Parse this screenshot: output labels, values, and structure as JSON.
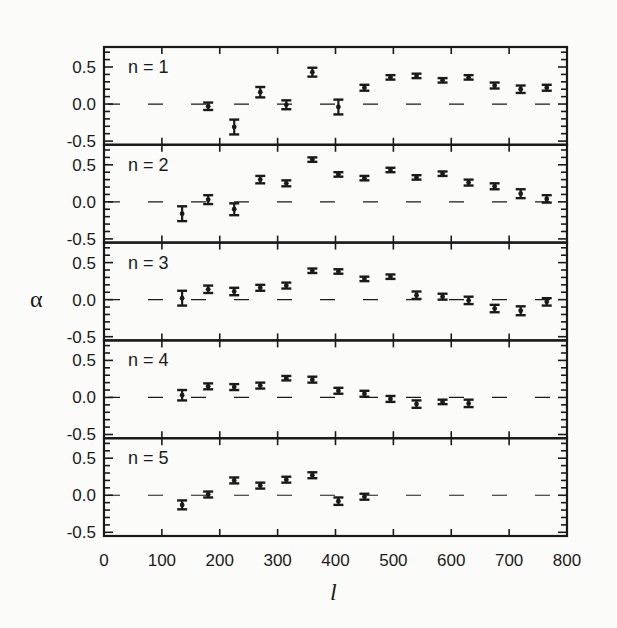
{
  "chart_data": {
    "type": "scatter",
    "title": "",
    "xlabel": "l",
    "ylabel": "α",
    "xlim": [
      0,
      800
    ],
    "ylim_per_panel": [
      -0.55,
      0.77
    ],
    "x_ticks": [
      0,
      100,
      200,
      300,
      400,
      500,
      600,
      700,
      800
    ],
    "y_ticks": [
      "0.5",
      "0.0",
      "-0.5"
    ],
    "grid": false,
    "legend": null,
    "reference_line": {
      "y": 0,
      "style": "dashed"
    },
    "error_bars": true,
    "panels": [
      {
        "label": "n = 1",
        "x": [
          180,
          225,
          270,
          315,
          360,
          405,
          450,
          495,
          540,
          585,
          630,
          675,
          720,
          765
        ],
        "y": [
          -0.03,
          -0.31,
          0.16,
          -0.01,
          0.43,
          -0.04,
          0.22,
          0.36,
          0.38,
          0.32,
          0.36,
          0.25,
          0.2,
          0.22
        ],
        "err": [
          0.05,
          0.1,
          0.07,
          0.06,
          0.06,
          0.1,
          0.04,
          0.03,
          0.03,
          0.03,
          0.03,
          0.04,
          0.05,
          0.04
        ]
      },
      {
        "label": "n = 2",
        "x": [
          135,
          180,
          225,
          270,
          315,
          360,
          405,
          450,
          495,
          540,
          585,
          630,
          675,
          720,
          765
        ],
        "y": [
          -0.16,
          0.03,
          -0.1,
          0.3,
          0.25,
          0.57,
          0.37,
          0.32,
          0.43,
          0.33,
          0.38,
          0.26,
          0.21,
          0.11,
          0.04
        ],
        "err": [
          0.1,
          0.06,
          0.08,
          0.05,
          0.04,
          0.03,
          0.03,
          0.03,
          0.03,
          0.03,
          0.03,
          0.04,
          0.04,
          0.06,
          0.05
        ]
      },
      {
        "label": "n = 3",
        "x": [
          135,
          180,
          225,
          270,
          315,
          360,
          405,
          450,
          495,
          540,
          585,
          630,
          675,
          720,
          765
        ],
        "y": [
          0.02,
          0.14,
          0.11,
          0.16,
          0.19,
          0.39,
          0.38,
          0.28,
          0.31,
          0.06,
          0.04,
          -0.01,
          -0.12,
          -0.15,
          -0.03
        ],
        "err": [
          0.1,
          0.05,
          0.05,
          0.04,
          0.04,
          0.03,
          0.03,
          0.03,
          0.03,
          0.05,
          0.04,
          0.05,
          0.05,
          0.06,
          0.05
        ]
      },
      {
        "label": "n = 4",
        "x": [
          135,
          180,
          225,
          270,
          315,
          360,
          405,
          450,
          495,
          540,
          585,
          630
        ],
        "y": [
          0.03,
          0.15,
          0.14,
          0.16,
          0.26,
          0.24,
          0.09,
          0.05,
          -0.02,
          -0.09,
          -0.06,
          -0.08
        ],
        "err": [
          0.07,
          0.04,
          0.04,
          0.04,
          0.03,
          0.04,
          0.04,
          0.04,
          0.04,
          0.05,
          0.03,
          0.05
        ]
      },
      {
        "label": "n = 5",
        "x": [
          135,
          180,
          225,
          270,
          315,
          360,
          405,
          450
        ],
        "y": [
          -0.13,
          0.01,
          0.2,
          0.13,
          0.21,
          0.27,
          -0.08,
          -0.02
        ],
        "err": [
          0.06,
          0.04,
          0.04,
          0.04,
          0.04,
          0.04,
          0.05,
          0.04
        ]
      }
    ]
  },
  "colors": {
    "ink": "#1a1a1a",
    "background": "#fbfbf9"
  }
}
